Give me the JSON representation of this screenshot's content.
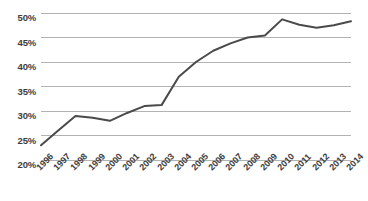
{
  "chart_data": {
    "type": "line",
    "title": "",
    "subtitle": "",
    "xlabel": "",
    "ylabel": "",
    "categories": [
      "1996",
      "1997",
      "1998",
      "1999",
      "2000",
      "2001",
      "2002",
      "2003",
      "2004",
      "2005",
      "2006",
      "2007",
      "2008",
      "2009",
      "2010",
      "2011",
      "2012",
      "2013",
      "2014"
    ],
    "values": [
      23.0,
      26.0,
      29.0,
      28.6,
      28.0,
      29.6,
      31.0,
      31.2,
      37.0,
      40.0,
      42.3,
      43.8,
      45.0,
      45.4,
      48.7,
      47.6,
      47.0,
      47.5,
      48.3
    ],
    "series": [
      {
        "name": "",
        "values": [
          23.0,
          26.0,
          29.0,
          28.6,
          28.0,
          29.6,
          31.0,
          31.2,
          37.0,
          40.0,
          42.3,
          43.8,
          45.0,
          45.4,
          48.7,
          47.6,
          47.0,
          47.5,
          48.3
        ]
      }
    ],
    "ylim": [
      20,
      50
    ],
    "yticks": [
      20,
      25,
      30,
      35,
      40,
      45,
      50
    ],
    "ytick_labels": [
      "20%",
      "25%",
      "30%",
      "35%",
      "40%",
      "45%",
      "50%"
    ],
    "xtick_labels": [
      "1996",
      "1997",
      "1998",
      "1999",
      "2000",
      "2001",
      "2002",
      "2003",
      "2004",
      "2005",
      "2006",
      "2007",
      "2008",
      "2009",
      "2010",
      "2011",
      "2012",
      "2013",
      "2014"
    ],
    "grid": true,
    "grid_axis": "y",
    "legend": false,
    "legend_position": "none",
    "line_color": "#4a4a4a",
    "grid_color": "#b2b2b2",
    "text_color": "#3d3d3d",
    "background_color": "#ffffff",
    "markers": false,
    "line_width": 2
  },
  "plot_geometry": {
    "left": 41,
    "right": 351,
    "top": 13,
    "bottom": 160
  }
}
